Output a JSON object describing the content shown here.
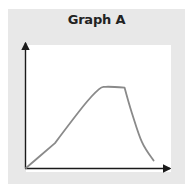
{
  "chart_data": {
    "type": "line",
    "title": "Graph A",
    "xlabel": "",
    "ylabel": "",
    "grid": false,
    "legend": null,
    "x_ticks": [],
    "y_ticks": [],
    "x": [
      0,
      0.2,
      0.4,
      0.5,
      0.55,
      0.68,
      0.73,
      0.8,
      0.88
    ],
    "series": [
      {
        "name": "curve",
        "color": "#8a8a8a",
        "values": [
          0,
          0.27,
          0.68,
          0.85,
          0.88,
          0.87,
          0.6,
          0.28,
          0.08
        ]
      }
    ],
    "xlim": [
      0,
      1
    ],
    "ylim": [
      0,
      1
    ]
  },
  "colors": {
    "panel": "#e8e8e8",
    "plot_background": "#ffffff",
    "axis": "#1a1a1a",
    "curve": "#8a8a8a",
    "title": "#222222"
  }
}
